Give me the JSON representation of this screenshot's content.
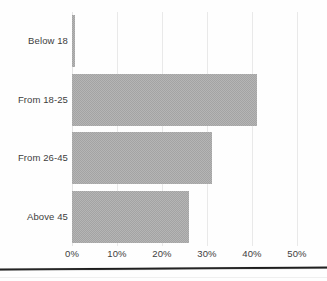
{
  "chart_data": {
    "type": "bar",
    "orientation": "horizontal",
    "title": "",
    "subtitle": "",
    "xlabel": "",
    "ylabel": "",
    "categories": [
      "Below 18",
      "From 18-25",
      "From 26-45",
      "Above 45"
    ],
    "values": [
      0.7,
      41,
      31,
      26
    ],
    "value_unit": "%",
    "series": [
      {
        "name": "Share of respondents",
        "values": [
          0.7,
          41,
          31,
          26
        ]
      }
    ],
    "xlim": [
      0,
      50
    ],
    "ylim": null,
    "x_ticks": [
      0,
      10,
      20,
      30,
      40,
      50
    ],
    "x_tick_labels": [
      "0%",
      "10%",
      "20%",
      "30%",
      "40%",
      "50%"
    ],
    "y_tick_labels": [
      "Below 18",
      "From 18-25",
      "From 26-45",
      "Above 45"
    ],
    "grid": "vertical",
    "legend": null,
    "legend_position": "none",
    "annotations": [],
    "colors": {
      "bar_fill": "#a3a3a3",
      "gridline": "#e9e9e9",
      "text": "#3d3d3d",
      "background": "#fefefe",
      "page_rule": "#1b1b1b"
    }
  }
}
